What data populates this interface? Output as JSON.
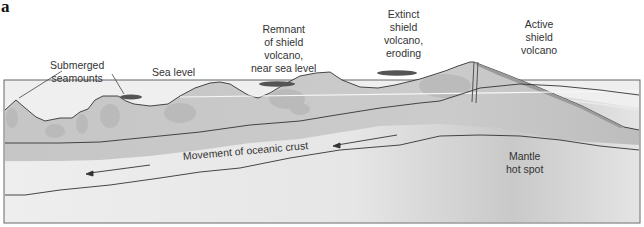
{
  "panel_letter": "a",
  "labels": {
    "submerged_seamounts": [
      "Submerged",
      "seamounts"
    ],
    "sea_level": "Sea level",
    "remnant": [
      "Remnant",
      "of shield",
      "volcano,",
      "near sea level"
    ],
    "extinct": [
      "Extinct",
      "shield",
      "volcano,",
      "eroding"
    ],
    "active": [
      "Active",
      "shield",
      "volcano"
    ],
    "movement": "Movement of oceanic crust",
    "mantle": [
      "Mantle",
      "hot spot"
    ]
  },
  "colors": {
    "sea": "#eeeeee",
    "crust": "#c8c8c8",
    "crust_shadow": "#b0b0b0",
    "lithosphere_band": "#e6e6e6",
    "mantle": "#e2e2e2",
    "line": "#333333",
    "lava_cap": "#555555"
  }
}
